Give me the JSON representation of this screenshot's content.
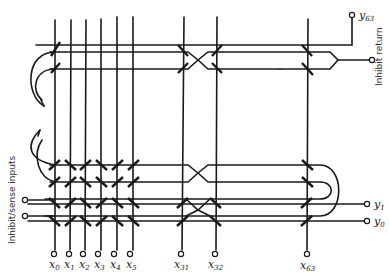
{
  "diagram": {
    "x_lines": [
      {
        "name": "x",
        "sub": "0",
        "x": 55
      },
      {
        "name": "x",
        "sub": "1",
        "x": 70
      },
      {
        "name": "x",
        "sub": "2",
        "x": 85
      },
      {
        "name": "x",
        "sub": "3",
        "x": 101
      },
      {
        "name": "x",
        "sub": "4",
        "x": 117
      },
      {
        "name": "x",
        "sub": "5",
        "x": 133
      },
      {
        "name": "x",
        "sub": "31",
        "x": 182
      },
      {
        "name": "x",
        "sub": "32",
        "x": 216
      },
      {
        "name": "x",
        "sub": "63",
        "x": 307
      }
    ],
    "y_labels": {
      "y63": {
        "name": "y",
        "sub": "63"
      },
      "y1": {
        "name": "y",
        "sub": "1"
      },
      "y0": {
        "name": "y",
        "sub": "0"
      }
    },
    "labels": {
      "inhibit_return": "Inhibit return",
      "inhibit_sense_inputs": "Inhibit/sense inputs"
    },
    "colors": {
      "ink": "#1a1a1a",
      "background": "#ffffff"
    }
  }
}
